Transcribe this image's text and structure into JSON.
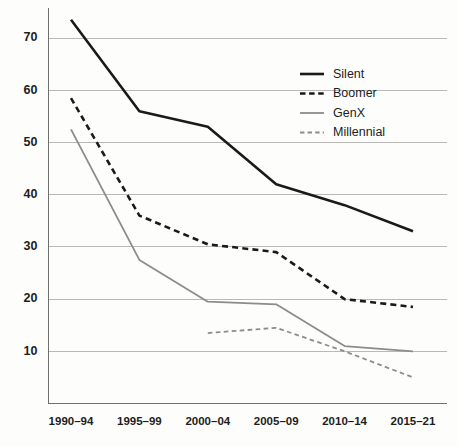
{
  "chart_data": {
    "type": "line",
    "title": "",
    "subtitle": "",
    "xlabel": "",
    "ylabel": "",
    "categories": [
      "1990–94",
      "1995–99",
      "2000–04",
      "2005–09",
      "2010–14",
      "2015–21"
    ],
    "ylim": [
      0,
      75
    ],
    "yticks": [
      10,
      20,
      30,
      40,
      50,
      60,
      70
    ],
    "ytick_labels": [
      "10",
      "20",
      "30",
      "40",
      "50",
      "60",
      "70"
    ],
    "grid": "horizontal",
    "legend_position": "upper-right",
    "series": [
      {
        "name": "Silent",
        "style": "solid",
        "color": "#1a1a1a",
        "width": 2.6,
        "values": [
          73.5,
          56,
          53,
          42,
          38,
          33
        ]
      },
      {
        "name": "Boomer",
        "style": "dashed",
        "color": "#1a1a1a",
        "width": 2.6,
        "values": [
          58.5,
          36,
          30.5,
          29,
          20,
          18.5
        ]
      },
      {
        "name": "GenX",
        "style": "solid",
        "color": "#8c8c8c",
        "width": 1.8,
        "values": [
          52.5,
          27.5,
          19.5,
          19,
          11,
          10
        ]
      },
      {
        "name": "Millennial",
        "style": "dashed",
        "color": "#8c8c8c",
        "width": 1.8,
        "values": [
          null,
          null,
          13.5,
          14.5,
          10,
          5
        ]
      }
    ]
  },
  "axes": {
    "y_axis_color": "#6f6f6f",
    "x_axis_color": "#6f6f6f",
    "gridline_color": "#b9b9b9"
  },
  "legend": {
    "entries": [
      {
        "label": "Silent"
      },
      {
        "label": "Boomer"
      },
      {
        "label": "GenX"
      },
      {
        "label": "Millennial"
      }
    ]
  }
}
